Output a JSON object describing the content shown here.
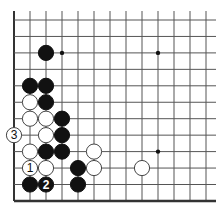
{
  "diagram": {
    "grid": {
      "cols": 13,
      "rows": 12,
      "x0": 14,
      "dx": 16,
      "y0": 20,
      "dy": 16.45
    },
    "colors": {
      "black": "#111111",
      "white": "#ffffff",
      "line": "#555555",
      "edge": "#333333"
    },
    "star_points": [
      {
        "col": 3,
        "row": 2
      },
      {
        "col": 9,
        "row": 2
      },
      {
        "col": 9,
        "row": 8
      }
    ],
    "stones": [
      {
        "color": "black",
        "col": 2,
        "row": 2,
        "label": ""
      },
      {
        "color": "black",
        "col": 1,
        "row": 4,
        "label": ""
      },
      {
        "color": "black",
        "col": 2,
        "row": 4,
        "label": ""
      },
      {
        "color": "white",
        "col": 1,
        "row": 5,
        "label": ""
      },
      {
        "color": "black",
        "col": 2,
        "row": 5,
        "label": ""
      },
      {
        "color": "white",
        "col": 1,
        "row": 6,
        "label": ""
      },
      {
        "color": "white",
        "col": 2,
        "row": 6,
        "label": ""
      },
      {
        "color": "black",
        "col": 3,
        "row": 6,
        "label": ""
      },
      {
        "color": "white",
        "col": 0,
        "row": 7,
        "label": "3"
      },
      {
        "color": "white",
        "col": 2,
        "row": 7,
        "label": ""
      },
      {
        "color": "black",
        "col": 3,
        "row": 7,
        "label": ""
      },
      {
        "color": "white",
        "col": 1,
        "row": 8,
        "label": ""
      },
      {
        "color": "black",
        "col": 2,
        "row": 8,
        "label": ""
      },
      {
        "color": "black",
        "col": 3,
        "row": 8,
        "label": ""
      },
      {
        "color": "white",
        "col": 5,
        "row": 8,
        "label": ""
      },
      {
        "color": "white",
        "col": 1,
        "row": 9,
        "label": "1"
      },
      {
        "color": "white",
        "col": 2,
        "row": 9,
        "label": ""
      },
      {
        "color": "black",
        "col": 4,
        "row": 9,
        "label": ""
      },
      {
        "color": "white",
        "col": 5,
        "row": 9,
        "label": ""
      },
      {
        "color": "white",
        "col": 8,
        "row": 9,
        "label": ""
      },
      {
        "color": "black",
        "col": 1,
        "row": 10,
        "label": ""
      },
      {
        "color": "black",
        "col": 2,
        "row": 10,
        "label": "2"
      },
      {
        "color": "black",
        "col": 4,
        "row": 10,
        "label": ""
      }
    ]
  }
}
